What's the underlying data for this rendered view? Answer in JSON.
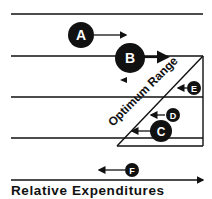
{
  "diagram": {
    "axis_label": "Relative Expenditures",
    "range_label": "Optimum Range",
    "nodes": [
      {
        "id": "A",
        "label": "A",
        "direction": "right"
      },
      {
        "id": "B",
        "label": "B",
        "direction": "right"
      },
      {
        "id": "C",
        "label": "C",
        "direction": "left"
      },
      {
        "id": "D",
        "label": "D",
        "direction": "left"
      },
      {
        "id": "E",
        "label": "E",
        "direction": "left"
      },
      {
        "id": "F",
        "label": "F",
        "direction": "left"
      }
    ],
    "colors": {
      "ink": "#111111",
      "background": "#ffffff"
    }
  }
}
